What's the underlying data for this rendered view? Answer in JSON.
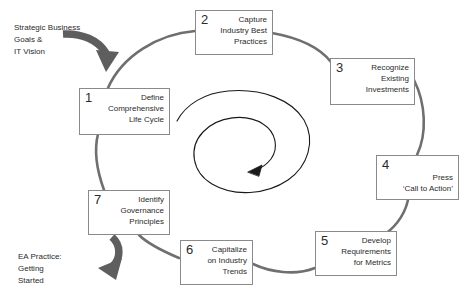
{
  "diagram": {
    "colors": {
      "ring": "#6f6f6f",
      "box_border": "#8a8a8a",
      "text": "#2b2b2b",
      "gray_arrow": "#5e5e5e",
      "spiral": "#1a1a1a",
      "background": "#ffffff"
    },
    "nodes": [
      {
        "number": "1",
        "lines": [
          "Define",
          "Comprehensive",
          "Life Cycle"
        ]
      },
      {
        "number": "2",
        "lines": [
          "Capture",
          "Industry Best",
          "Practices"
        ]
      },
      {
        "number": "3",
        "lines": [
          "Recognize",
          "Existing",
          "Investments"
        ]
      },
      {
        "number": "4",
        "lines": [
          "Press",
          "‘Call to Action’"
        ]
      },
      {
        "number": "5",
        "lines": [
          "Develop",
          "Requirements",
          "for Metrics"
        ]
      },
      {
        "number": "6",
        "lines": [
          "Capitalize",
          "on Industry",
          "Trends"
        ]
      },
      {
        "number": "7",
        "lines": [
          "Identify",
          "Governance",
          "Principles"
        ]
      }
    ],
    "annotations": [
      {
        "name": "input-label",
        "lines": [
          "Strategic Business",
          "Goals &",
          "IT Vision"
        ]
      },
      {
        "name": "output-label",
        "lines": [
          "EA Practice:",
          "Getting",
          "Started"
        ]
      }
    ]
  }
}
